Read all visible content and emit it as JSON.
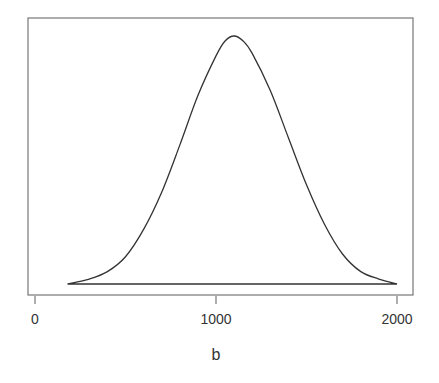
{
  "chart_data": {
    "type": "line",
    "title": "",
    "xlabel": "b",
    "ylabel": "",
    "xlim": [
      -40,
      2100
    ],
    "x_ticks": [
      0,
      1000,
      2000
    ],
    "x_tick_labels": [
      "0",
      "1000",
      "2000"
    ],
    "y_ticks": [],
    "grid": false,
    "legend": null,
    "series": [
      {
        "name": "density",
        "description": "Bell-shaped curve closed along baseline (polygon)",
        "x": [
          180,
          300,
          400,
          500,
          600,
          700,
          800,
          900,
          1000,
          1050,
          1100,
          1150,
          1200,
          1300,
          1400,
          1500,
          1600,
          1700,
          1800,
          1900,
          2000
        ],
        "y": [
          0.0,
          0.02,
          0.05,
          0.11,
          0.22,
          0.37,
          0.56,
          0.76,
          0.92,
          0.98,
          1.0,
          0.98,
          0.93,
          0.78,
          0.59,
          0.4,
          0.24,
          0.12,
          0.05,
          0.02,
          0.0
        ]
      }
    ],
    "peak_x": 1100,
    "color": "#333333"
  },
  "axis": {
    "x_label": "b",
    "ticks": [
      "0",
      "1000",
      "2000"
    ]
  }
}
